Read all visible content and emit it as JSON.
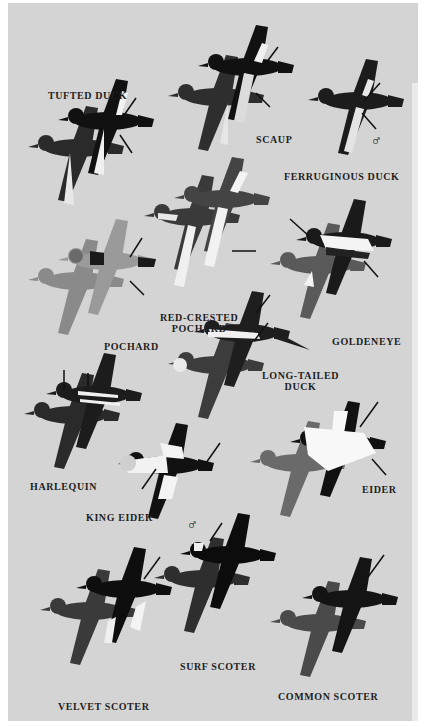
{
  "plate": {
    "background": "#d4d4d4",
    "species": [
      {
        "id": "tufted-duck",
        "label": "TUFTED DUCK",
        "x": 40,
        "y": 87
      },
      {
        "id": "scaup",
        "label": "SCAUP",
        "x": 248,
        "y": 131
      },
      {
        "id": "ferruginous-duck",
        "label": "FERRUGINOUS DUCK",
        "x": 278,
        "y": 168
      },
      {
        "id": "pochard",
        "label": "POCHARD",
        "x": 96,
        "y": 338
      },
      {
        "id": "red-crested-pochard",
        "label": "RED-CRESTED\nPOCHARD",
        "line1": "RED-CRESTED",
        "line2": "POCHARD",
        "x": 154,
        "y": 309
      },
      {
        "id": "goldeneye",
        "label": "GOLDENEYE",
        "x": 324,
        "y": 333
      },
      {
        "id": "long-tailed-duck",
        "label": "LONG-TAILED\nDUCK",
        "line1": "LONG-TAILED",
        "line2": "DUCK",
        "x": 256,
        "y": 367
      },
      {
        "id": "harlequin",
        "label": "HARLEQUIN",
        "x": 28,
        "y": 478
      },
      {
        "id": "eider",
        "label": "EIDER",
        "x": 354,
        "y": 481
      },
      {
        "id": "king-eider",
        "label": "KING EIDER",
        "x": 82,
        "y": 509
      },
      {
        "id": "surf-scoter",
        "label": "SURF SCOTER",
        "x": 173,
        "y": 658
      },
      {
        "id": "common-scoter",
        "label": "COMMON SCOTER",
        "x": 273,
        "y": 688
      },
      {
        "id": "velvet-scoter",
        "label": "VELVET SCOTER",
        "x": 53,
        "y": 698
      }
    ],
    "male_symbol": "♂"
  }
}
